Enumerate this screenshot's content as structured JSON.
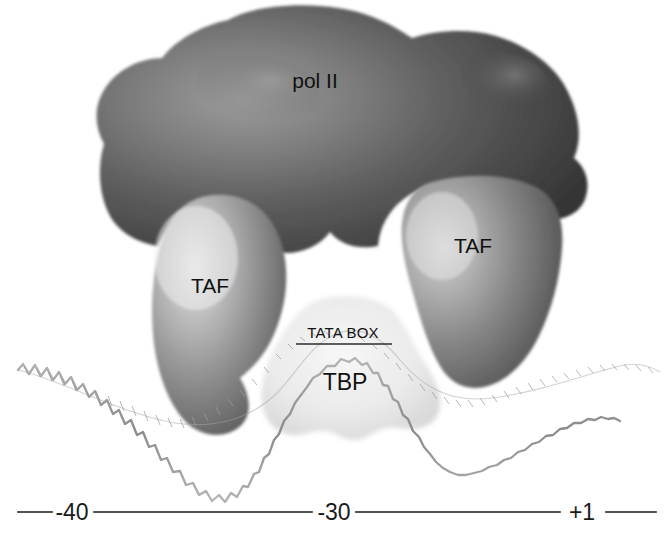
{
  "figure": {
    "background_color": "#ffffff"
  },
  "complexes": [
    {
      "id": "pol2",
      "label": "pol II",
      "role": "rna-polymerase-ii",
      "fill_color": "#4a4a4a",
      "highlight_color": "#9a9a9a",
      "label_color": "#111111",
      "label_x": 315,
      "label_y": 88
    },
    {
      "id": "taf-left",
      "label": "TAF",
      "role": "tata-binding-protein-associated-factor",
      "fill_color": "#7d7d7d",
      "highlight_color": "#d8d8d8",
      "label_color": "#111111",
      "label_x": 210,
      "label_y": 293
    },
    {
      "id": "taf-right",
      "label": "TAF",
      "role": "tata-binding-protein-associated-factor",
      "fill_color": "#6e6e6e",
      "highlight_color": "#c9c9c9",
      "label_color": "#111111",
      "label_x": 473,
      "label_y": 253
    },
    {
      "id": "tbp",
      "label": "TBP",
      "role": "tata-binding-protein",
      "fill_color": "#e4e4e4",
      "highlight_color": "#f4f4f4",
      "label_color": "#111111",
      "label_x": 345,
      "label_y": 390
    }
  ],
  "dna": {
    "label": "TATA BOX",
    "label_x": 343,
    "label_y": 338,
    "strand_color": "#8e8e8e",
    "underline_color": "#2a2a2a"
  },
  "scale": {
    "ticks": [
      {
        "label": "-40",
        "x": 72
      },
      {
        "label": "-30",
        "x": 334
      },
      {
        "label": "+1",
        "x": 582
      }
    ],
    "line_color": "#1a1a1a",
    "baseline_y": 512
  }
}
